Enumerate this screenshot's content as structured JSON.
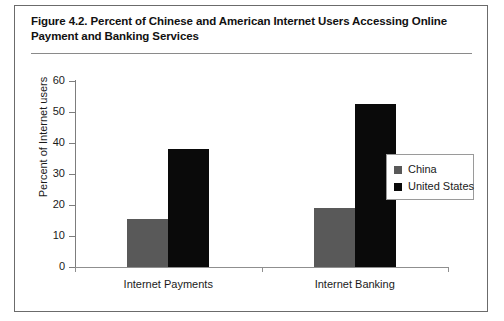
{
  "figure": {
    "title": "Figure 4.2. Percent of Chinese and American Internet Users Accessing Online Payment and Banking Services"
  },
  "chart_data": {
    "type": "bar",
    "title": "",
    "xlabel": "",
    "ylabel": "Percent of Internet users",
    "categories": [
      "Internet Payments",
      "Internet Banking"
    ],
    "series": [
      {
        "name": "China",
        "color": "#595959",
        "values": [
          15.5,
          19
        ]
      },
      {
        "name": "United States",
        "color": "#0a0a0a",
        "values": [
          38,
          52.5
        ]
      }
    ],
    "ylim": [
      0,
      60
    ],
    "yticks": [
      0,
      10,
      20,
      30,
      40,
      50,
      60
    ],
    "ytick_labels": [
      "0",
      "10",
      "20",
      "30",
      "40",
      "50",
      "60"
    ],
    "grid": false,
    "legend_position": "right"
  },
  "legend": {
    "items": [
      {
        "label": "China"
      },
      {
        "label": "United States"
      }
    ]
  }
}
